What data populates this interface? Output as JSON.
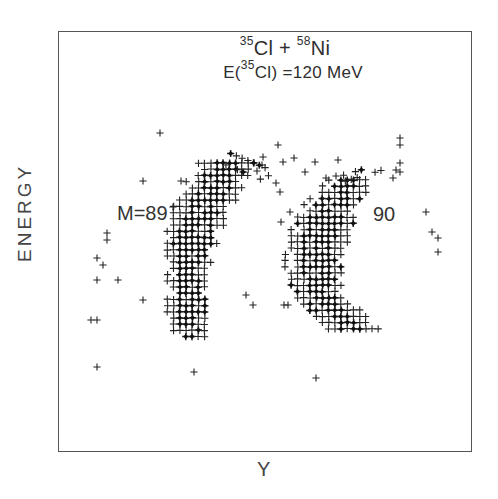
{
  "chart_data": {
    "type": "scatter",
    "title": {
      "reaction": {
        "a_mass": "35",
        "a_sym": "Cl",
        "plus": " + ",
        "b_mass": "58",
        "b_sym": "Ni"
      },
      "energy": {
        "prefix": "E(",
        "mass": "35",
        "sym": "Cl",
        "suffix": ") =120 MeV"
      }
    },
    "xlabel": "Y",
    "ylabel": "ENERGY",
    "axis_ticks": "none",
    "grid": false,
    "legend": "none",
    "annotations": [
      {
        "text": "M=89",
        "near": "left cluster"
      },
      {
        "text": "90",
        "near": "right cluster"
      }
    ],
    "marker": "plus (sparse) / bold diamond-plus (dense)",
    "series": [
      {
        "name": "M=89",
        "description": "Dense curved band, crescent shape; top ~y=160, bottom ~y=340 (pixel coords), x range ~165-275",
        "spine": [
          [
            228,
            163
          ],
          [
            218,
            180
          ],
          [
            207,
            200
          ],
          [
            198,
            220
          ],
          [
            192,
            245
          ],
          [
            188,
            270
          ],
          [
            187,
            295
          ],
          [
            188,
            318
          ],
          [
            192,
            340
          ]
        ],
        "half_width": [
          28,
          30,
          30,
          28,
          24,
          20,
          18,
          18,
          14
        ],
        "core_half_width": [
          12,
          16,
          18,
          18,
          16,
          14,
          12,
          11,
          6
        ],
        "upper_arm": {
          "from": [
            228,
            160
          ],
          "to": [
            272,
            178
          ],
          "width": 14
        }
      },
      {
        "name": "M=90",
        "description": "Dense mirrored band; top ~y=178, bottom ~y=338, x range ~285-395",
        "spine": [
          [
            352,
            180
          ],
          [
            340,
            195
          ],
          [
            328,
            215
          ],
          [
            318,
            240
          ],
          [
            315,
            265
          ],
          [
            320,
            290
          ],
          [
            335,
            312
          ],
          [
            360,
            330
          ]
        ],
        "half_width": [
          22,
          28,
          30,
          30,
          28,
          26,
          26,
          30
        ],
        "core_half_width": [
          8,
          14,
          18,
          18,
          16,
          14,
          10,
          6
        ],
        "upper_arm": {
          "from": [
            345,
            180
          ],
          "to": [
            385,
            168
          ],
          "width": 10
        }
      }
    ],
    "outliers": [
      [
        160,
        133
      ],
      [
        143,
        181
      ],
      [
        181,
        181
      ],
      [
        173,
        207
      ],
      [
        107,
        233
      ],
      [
        107,
        240
      ],
      [
        97,
        258
      ],
      [
        103,
        265
      ],
      [
        97,
        280
      ],
      [
        118,
        280
      ],
      [
        143,
        300
      ],
      [
        91,
        320
      ],
      [
        97,
        320
      ],
      [
        97,
        367
      ],
      [
        194,
        372
      ],
      [
        278,
        145
      ],
      [
        263,
        157
      ],
      [
        262,
        165
      ],
      [
        283,
        162
      ],
      [
        294,
        158
      ],
      [
        276,
        183
      ],
      [
        280,
        192
      ],
      [
        281,
        222
      ],
      [
        290,
        212
      ],
      [
        305,
        172
      ],
      [
        315,
        162
      ],
      [
        326,
        178
      ],
      [
        338,
        160
      ],
      [
        336,
        176
      ],
      [
        396,
        170
      ],
      [
        400,
        172
      ],
      [
        400,
        163
      ],
      [
        400,
        145
      ],
      [
        400,
        138
      ],
      [
        393,
        178
      ],
      [
        426,
        212
      ],
      [
        432,
        232
      ],
      [
        438,
        238
      ],
      [
        438,
        252
      ],
      [
        316,
        378
      ],
      [
        288,
        305
      ],
      [
        284,
        305
      ],
      [
        253,
        305
      ],
      [
        246,
        295
      ]
    ]
  }
}
